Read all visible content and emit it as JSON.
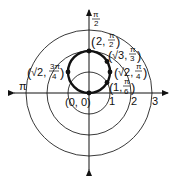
{
  "diagram": {
    "type": "polar-graph",
    "center_px": [
      89,
      93
    ],
    "unit_px": 21,
    "axes": {
      "polar_axis_label": "",
      "angle_labels": [
        {
          "id": "pi-half",
          "num": "π",
          "den": "2"
        },
        {
          "id": "pi",
          "text": "π"
        }
      ],
      "tick_labels": [
        "1",
        "2",
        "3"
      ]
    },
    "grid_circles": [
      1,
      2,
      3
    ],
    "curve": {
      "equation": "r = 2 sin θ",
      "description": "circle of diameter 2 through origin, centered on π/2 ray"
    },
    "points": [
      {
        "id": "origin",
        "label": "(0, 0)",
        "r": "0",
        "theta": "0"
      },
      {
        "id": "p-1-pi6",
        "r": "1",
        "theta_num": "π",
        "theta_den": "6"
      },
      {
        "id": "p-sqrt2-pi4",
        "r": "√2",
        "theta_num": "π",
        "theta_den": "4"
      },
      {
        "id": "p-sqrt3-pi3",
        "r": "√3",
        "theta_num": "π",
        "theta_den": "3"
      },
      {
        "id": "p-2-pi2",
        "r": "2",
        "theta_num": "π",
        "theta_den": "2"
      },
      {
        "id": "p-sqrt2-3pi4",
        "r": "√2",
        "theta_num": "3π",
        "theta_den": "4"
      }
    ],
    "colors": {
      "ink": "#111111",
      "background": "#ffffff"
    }
  }
}
